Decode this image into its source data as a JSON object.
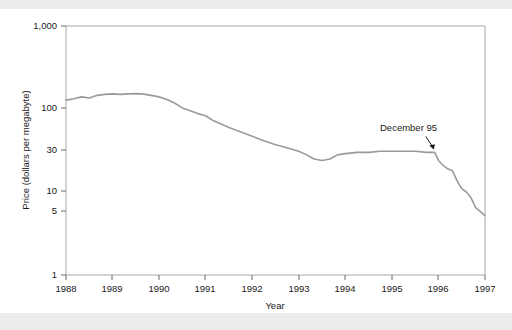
{
  "figure": {
    "background_color": "#ffffff",
    "band_color": "#ececec",
    "line_color": "#9a9a9a",
    "axis_color": "#a8a8a8",
    "text_color": "#1a1a1a"
  },
  "chart_data": {
    "type": "line",
    "title": "",
    "subtitle": "",
    "xlabel": "Year",
    "ylabel": "Price (dollars per megabyte)",
    "yscale": "log",
    "ylim": [
      1,
      1000
    ],
    "xlim": [
      1988,
      1997
    ],
    "grid": false,
    "legend": "none",
    "ytick_labels": [
      "1,000",
      "100",
      "30",
      "10",
      "5",
      "1"
    ],
    "ytick_values": [
      1000,
      100,
      30,
      10,
      5,
      1
    ],
    "xtick_labels": [
      "1988",
      "1989",
      "1990",
      "1991",
      "1992",
      "1993",
      "1994",
      "1995",
      "1996",
      "1997"
    ],
    "xtick_values": [
      1988,
      1989,
      1990,
      1991,
      1992,
      1993,
      1994,
      1995,
      1996,
      1997
    ],
    "annotations": [
      {
        "text": "December 95",
        "x": 1995.92,
        "y": 30.0
      }
    ],
    "series": [
      {
        "name": "Price per megabyte",
        "x": [
          1988.0,
          1988.17,
          1988.33,
          1988.5,
          1988.67,
          1988.83,
          1989.0,
          1989.17,
          1989.33,
          1989.5,
          1989.67,
          1989.83,
          1990.0,
          1990.17,
          1990.33,
          1990.5,
          1990.67,
          1990.83,
          1991.0,
          1991.17,
          1991.33,
          1991.5,
          1991.67,
          1991.83,
          1992.0,
          1992.17,
          1992.33,
          1992.5,
          1992.67,
          1992.83,
          1993.0,
          1993.17,
          1993.33,
          1993.5,
          1993.67,
          1993.83,
          1994.0,
          1994.25,
          1994.5,
          1994.75,
          1995.0,
          1995.25,
          1995.5,
          1995.75,
          1995.92,
          1996.0,
          1996.1,
          1996.2,
          1996.3,
          1996.42,
          1996.5,
          1996.6,
          1996.7,
          1996.8,
          1997.0
        ],
        "values": [
          128,
          133,
          140,
          136,
          146,
          150,
          152,
          150,
          152,
          153,
          151,
          146,
          140,
          130,
          118,
          103,
          95,
          88,
          83,
          72,
          66,
          60,
          55,
          51,
          47,
          43,
          40,
          37,
          35,
          33,
          31,
          28,
          25,
          24,
          25,
          28,
          29,
          30,
          30,
          31,
          31,
          31,
          31,
          30,
          30,
          24,
          21,
          19,
          18,
          13,
          11,
          10,
          8.5,
          6.5,
          5.2
        ]
      }
    ]
  },
  "axes": {
    "ylabel": "Price (dollars per megabyte)",
    "xlabel": "Year"
  }
}
